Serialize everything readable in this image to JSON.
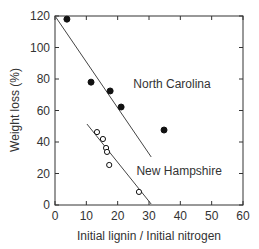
{
  "chart_data": {
    "type": "scatter",
    "title": "",
    "xlabel": "Initial lignin / Initial nitrogen",
    "ylabel": "Weight loss (%)",
    "xlim": [
      0,
      60
    ],
    "ylim": [
      0,
      120
    ],
    "xticks": [
      0,
      10,
      20,
      30,
      40,
      50,
      60
    ],
    "yticks": [
      0,
      20,
      40,
      60,
      80,
      100,
      120
    ],
    "grid": false,
    "legend": "none",
    "series": [
      {
        "name": "North Carolina",
        "marker": "filled-circle",
        "points": [
          {
            "x": 3.8,
            "y": 118
          },
          {
            "x": 11.5,
            "y": 78
          },
          {
            "x": 17.6,
            "y": 72.4
          },
          {
            "x": 21.1,
            "y": 62.2
          },
          {
            "x": 34.8,
            "y": 47.6
          }
        ],
        "fit_line": {
          "x1": 0,
          "y1": 120,
          "x2": 30.7,
          "y2": 30.5
        },
        "label": {
          "text": "North Carolina",
          "x": 25,
          "y": 74
        }
      },
      {
        "name": "New Hampshire",
        "marker": "open-circle",
        "points": [
          {
            "x": 13.4,
            "y": 46.3
          },
          {
            "x": 15.3,
            "y": 41.9
          },
          {
            "x": 16.3,
            "y": 36.2
          },
          {
            "x": 16.6,
            "y": 33.7
          },
          {
            "x": 17.3,
            "y": 25.4
          },
          {
            "x": 26.8,
            "y": 8.3
          }
        ],
        "fit_line": {
          "x1": 10.2,
          "y1": 51.4,
          "x2": 30.7,
          "y2": 0.6
        },
        "label": {
          "text": "New Hampshire",
          "x": 26,
          "y": 19
        }
      }
    ]
  },
  "colors": {
    "axis": "#333333",
    "marker": "#111111",
    "line": "#444444"
  }
}
